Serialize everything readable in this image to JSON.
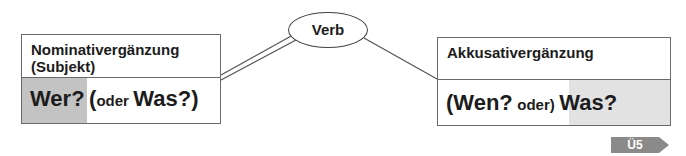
{
  "diagram": {
    "center": {
      "label": "Verb"
    },
    "left_box": {
      "title_line1": "Nominativergänzung",
      "title_line2": "(Subjekt)",
      "question_main": "Wer?",
      "question_open": "(",
      "question_oder": "oder",
      "question_alt": "Was?)",
      "connector": "double-line"
    },
    "right_box": {
      "title_line1": "Akkusativergänzung",
      "question_open": "(Wen?",
      "question_oder": "oder)",
      "question_main": "Was?",
      "connector": "single-line"
    },
    "exercise_tag": {
      "label": "Ü5"
    }
  },
  "colors": {
    "border": "#6a6a6a",
    "highlight": "#c3c3c3",
    "tag": "#8a8a8a",
    "text": "#1c1c1c"
  }
}
